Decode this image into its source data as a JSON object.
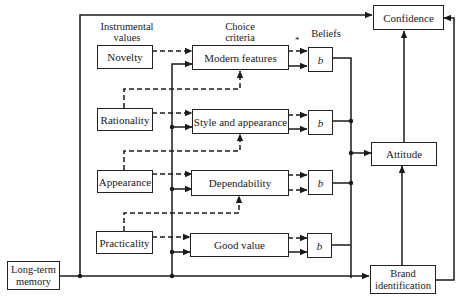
{
  "diagram": {
    "headers": {
      "instrumental_values": "Instrumental\nvalues",
      "choice_criteria": "Choice\ncriteria",
      "beliefs": "Beliefs",
      "asterisk": "*"
    },
    "instrumental_values": [
      {
        "label": "Novelty"
      },
      {
        "label": "Rationality"
      },
      {
        "label": "Appearance"
      },
      {
        "label": "Practicality"
      }
    ],
    "choice_criteria": [
      {
        "label": "Modern features"
      },
      {
        "label": "Style and appearance"
      },
      {
        "label": "Dependability"
      },
      {
        "label": "Good value"
      }
    ],
    "beliefs": [
      {
        "label": "b"
      },
      {
        "label": "b"
      },
      {
        "label": "b"
      },
      {
        "label": "b"
      }
    ],
    "outcomes": {
      "confidence": "Confidence",
      "attitude": "Attitude",
      "brand_identification": "Brand\nidentification"
    },
    "source": {
      "long_term_memory": "Long-term\nmemory"
    },
    "colors": {
      "line": "#1a1a1a",
      "background": "#ffffff"
    }
  }
}
